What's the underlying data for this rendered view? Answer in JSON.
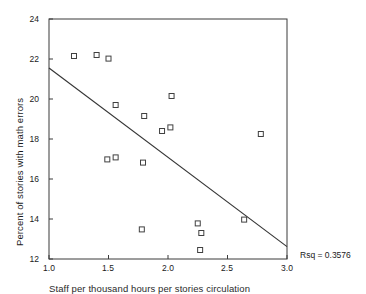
{
  "chart_data": {
    "type": "scatter",
    "title": "",
    "xlabel": "Staff per thousand hours per stories circulation",
    "ylabel": "Percent of stories with math errors",
    "xlim": [
      1.0,
      3.0
    ],
    "ylim": [
      12,
      24
    ],
    "xticks": [
      "1.0",
      "1.5",
      "2.0",
      "2.5",
      "3.0"
    ],
    "xtick_values": [
      1.0,
      1.5,
      2.0,
      2.5,
      3.0
    ],
    "yticks": [
      "12",
      "14",
      "16",
      "18",
      "20",
      "22",
      "24"
    ],
    "ytick_values": [
      12,
      14,
      16,
      18,
      20,
      22,
      24
    ],
    "grid": false,
    "legend": null,
    "marker": "open-square",
    "points": [
      {
        "x": 1.21,
        "y": 22.15
      },
      {
        "x": 1.4,
        "y": 22.2
      },
      {
        "x": 1.5,
        "y": 22.02
      },
      {
        "x": 1.56,
        "y": 19.7
      },
      {
        "x": 1.8,
        "y": 19.15
      },
      {
        "x": 2.03,
        "y": 20.15
      },
      {
        "x": 1.95,
        "y": 18.4
      },
      {
        "x": 2.02,
        "y": 18.58
      },
      {
        "x": 2.78,
        "y": 18.25
      },
      {
        "x": 1.49,
        "y": 16.98
      },
      {
        "x": 1.56,
        "y": 17.08
      },
      {
        "x": 1.79,
        "y": 16.82
      },
      {
        "x": 2.64,
        "y": 13.97
      },
      {
        "x": 2.25,
        "y": 13.78
      },
      {
        "x": 2.28,
        "y": 13.3
      },
      {
        "x": 1.78,
        "y": 13.48
      },
      {
        "x": 2.27,
        "y": 12.45
      }
    ],
    "fit_line": {
      "label": "linear-regression",
      "x1": 1.0,
      "y1": 21.55,
      "x2": 3.0,
      "y2": 12.62
    },
    "annotations": [
      {
        "name": "rsq",
        "text": "Rsq = 0.3576"
      }
    ]
  },
  "annotation_rsq": "Rsq = 0.3576",
  "axis": {
    "y_label": "Percent of stories with math errors",
    "x_label": "Staff per thousand hours per stories circulation"
  }
}
